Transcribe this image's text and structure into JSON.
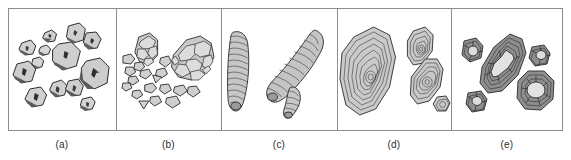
{
  "figure": {
    "type": "multi-panel-line-drawing-plate",
    "panel_count": 5,
    "frame_color": "#8d8d8d",
    "background_color": "#ffffff",
    "ink_color": "#2b2b2b",
    "fill_light": "#d8d8d8",
    "fill_mid": "#b5b5b5",
    "fill_dark": "#6e6e6e"
  },
  "panels": [
    {
      "id": "a",
      "caption": "(a)",
      "subject": "angular to sub-rounded clasts",
      "description": "Scattered equant grains with dark shaded margins and small internal marks",
      "object_count": 13
    },
    {
      "id": "b",
      "caption": "(b)",
      "subject": "clasts with internal mosaic texture",
      "description": "Two large polygonal-celled grains with numerous small angular fragments",
      "object_count": 17
    },
    {
      "id": "c",
      "caption": "(c)",
      "subject": "elongate ribbed columns",
      "description": "Three finger-like forms with fine transverse banding",
      "object_count": 3
    },
    {
      "id": "d",
      "caption": "(d)",
      "subject": "concentrically laminated bodies",
      "description": "Four nested-lamina forms, one large, two medium, one small",
      "object_count": 4
    },
    {
      "id": "e",
      "caption": "(e)",
      "subject": "cortex-and-nucleus grains",
      "description": "Five grains with dark concentric cortices around pale radially cracked nuclei",
      "object_count": 5
    }
  ]
}
